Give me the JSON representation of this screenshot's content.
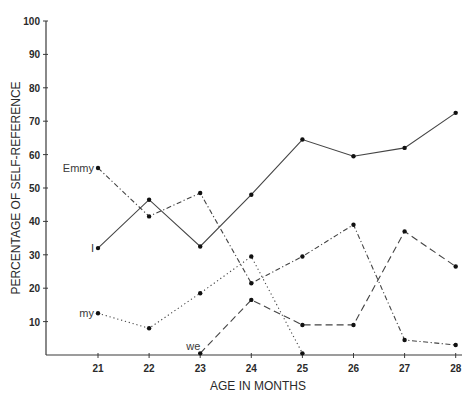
{
  "chart_data": {
    "type": "line",
    "title": "",
    "xlabel": "AGE IN MONTHS",
    "ylabel": "PERCENTAGE OF SELF-REFERENCE",
    "x": [
      21,
      22,
      23,
      24,
      25,
      26,
      27,
      28
    ],
    "xlim": [
      20,
      28
    ],
    "ylim": [
      0,
      100
    ],
    "yticks": [
      10,
      20,
      30,
      40,
      50,
      60,
      70,
      80,
      90,
      100
    ],
    "grid": false,
    "legend": "inline labels at series start",
    "series": [
      {
        "name": "Emmy",
        "style": "dash-dot",
        "x": [
          21,
          22,
          23,
          24,
          25,
          26,
          27,
          28
        ],
        "values": [
          56,
          41.5,
          48.5,
          21.5,
          29.5,
          39,
          4.5,
          3
        ]
      },
      {
        "name": "I",
        "style": "solid",
        "x": [
          21,
          22,
          23,
          24,
          25,
          26,
          27,
          28
        ],
        "values": [
          32,
          46.5,
          32.5,
          48,
          64.5,
          59.5,
          62,
          72.5
        ]
      },
      {
        "name": "my",
        "style": "dotted",
        "x": [
          21,
          22,
          23,
          24,
          25
        ],
        "values": [
          12.5,
          8,
          18.5,
          29.5,
          0.5
        ]
      },
      {
        "name": "we",
        "style": "dashed",
        "x": [
          23,
          24,
          25,
          26,
          27,
          28
        ],
        "values": [
          0.5,
          16.5,
          9,
          9,
          37,
          26.5
        ]
      }
    ]
  }
}
